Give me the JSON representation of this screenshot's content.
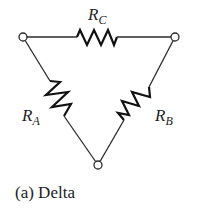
{
  "diagram": {
    "type": "delta-resistor-network",
    "caption": "(a) Delta",
    "nodes": [
      {
        "id": "top-left",
        "x": 23,
        "y": 37
      },
      {
        "id": "top-right",
        "x": 175,
        "y": 37
      },
      {
        "id": "bottom",
        "x": 98,
        "y": 165
      }
    ],
    "resistors": [
      {
        "id": "RC",
        "letter": "R",
        "subscript": "C",
        "between": [
          "top-left",
          "top-right"
        ]
      },
      {
        "id": "RA",
        "letter": "R",
        "subscript": "A",
        "between": [
          "top-left",
          "bottom"
        ]
      },
      {
        "id": "RB",
        "letter": "R",
        "subscript": "B",
        "between": [
          "top-right",
          "bottom"
        ]
      }
    ],
    "colors": {
      "line": "#2a2a2a",
      "background": "#ffffff"
    }
  }
}
